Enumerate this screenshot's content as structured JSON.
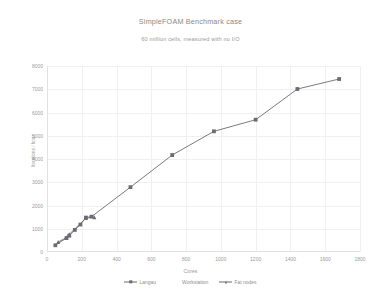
{
  "chart_data": {
    "type": "line",
    "title": "SimpleFOAM Benchmark case",
    "subtitle": "60 million cells, measured with no I/O",
    "xlabel": "Cores",
    "ylabel": "Iterations / hour",
    "xlim": [
      0,
      1800
    ],
    "ylim": [
      0,
      8000
    ],
    "grid": true,
    "legend_position": "bottom",
    "xticks": [
      "0",
      "200",
      "400",
      "600",
      "800",
      "1000",
      "1200",
      "1400",
      "1600",
      "1800"
    ],
    "yticks": [
      "0",
      "1000",
      "2000",
      "3000",
      "4000",
      "5000",
      "6000",
      "7000",
      "8000"
    ],
    "colors": {
      "langau": "#6b6b73",
      "workstation": "#8d8d95",
      "fat_nodes": "#6b6b73",
      "grid": "#f0f0f0",
      "axis": "#e2e2e2",
      "text": "#9b9b9b"
    },
    "series": [
      {
        "name": "Langau",
        "marker": "square",
        "color": "#6b6b73",
        "points": [
          {
            "x": 48,
            "y": 290
          },
          {
            "x": 112,
            "y": 600
          },
          {
            "x": 128,
            "y": 700
          },
          {
            "x": 160,
            "y": 950
          },
          {
            "x": 192,
            "y": 1180
          },
          {
            "x": 224,
            "y": 1480
          },
          {
            "x": 256,
            "y": 1520
          },
          {
            "x": 480,
            "y": 2790
          },
          {
            "x": 720,
            "y": 4170
          },
          {
            "x": 960,
            "y": 5190
          },
          {
            "x": 1200,
            "y": 5690
          },
          {
            "x": 1440,
            "y": 7010
          },
          {
            "x": 1680,
            "y": 7440
          }
        ]
      },
      {
        "name": "Workstation",
        "marker": "none",
        "color": "#8d8d95",
        "points": []
      },
      {
        "name": "Fat nodes",
        "marker": "triangle",
        "color": "#6b6b73",
        "points": [
          {
            "x": 64,
            "y": 430
          },
          {
            "x": 112,
            "y": 620
          },
          {
            "x": 128,
            "y": 760
          },
          {
            "x": 224,
            "y": 1460
          },
          {
            "x": 272,
            "y": 1500
          }
        ]
      }
    ]
  },
  "legend": {
    "items": [
      {
        "label": "Langau",
        "marker": "square"
      },
      {
        "label": "Workstation",
        "marker": "none"
      },
      {
        "label": "Fat nodes",
        "marker": "triangle"
      }
    ]
  }
}
